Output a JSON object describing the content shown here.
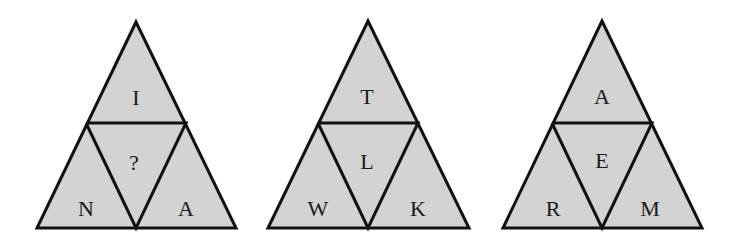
{
  "puzzle": {
    "fill_color": "#d3d3d3",
    "stroke_color": "#111111",
    "background": "#ffffff",
    "triangles": [
      {
        "top": "I",
        "center": "?",
        "left": "N",
        "right": "A"
      },
      {
        "top": "T",
        "center": "L",
        "left": "W",
        "right": "K"
      },
      {
        "top": "A",
        "center": "E",
        "left": "R",
        "right": "M"
      }
    ]
  }
}
